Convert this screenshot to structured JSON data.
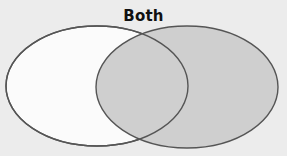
{
  "diagram": {
    "type": "venn",
    "label_intersection": "Both",
    "colors": {
      "background": "#ececec",
      "left_fill": "#fbfbfb",
      "right_fill": "#cfcfcf",
      "stroke": "#555555",
      "label": "#111111"
    },
    "sets": [
      {
        "name": "left-set",
        "cx": 97,
        "cy": 86,
        "rx": 91,
        "ry": 60
      },
      {
        "name": "right-set",
        "cx": 187,
        "cy": 87,
        "rx": 91,
        "ry": 61
      }
    ]
  }
}
